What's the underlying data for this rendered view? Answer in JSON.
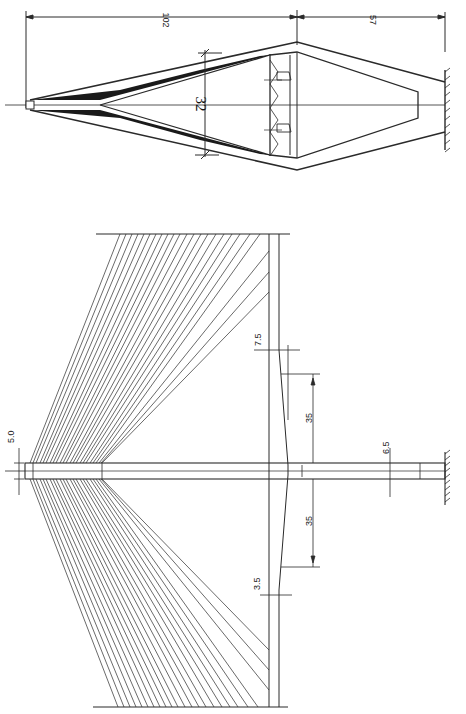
{
  "figure": {
    "colors": {
      "line": "#2a2a2a",
      "fill_dark": "#1a1a1a",
      "paper": "#ffffff"
    }
  },
  "transverse_view": {
    "dims": {
      "total_height": "102",
      "lower_height": "57",
      "deck_width": "32"
    }
  },
  "elevation_view": {
    "dims": {
      "top_width": "5.0",
      "side_span_width": "3.5",
      "mid_width": "7.5",
      "left_length": "35",
      "right_length": "35",
      "base_width": "6.5"
    },
    "cables_per_side": 22
  }
}
